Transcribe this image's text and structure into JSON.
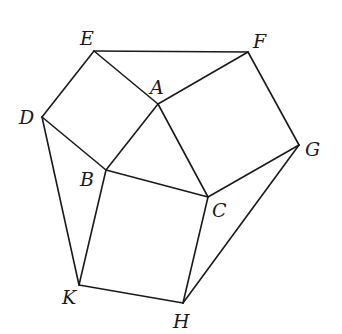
{
  "diagram": {
    "type": "geometry",
    "colors": {
      "stroke": "#1a1a1a",
      "background": "#ffffff"
    },
    "points": {
      "A": {
        "x": 158,
        "y": 104,
        "label": "A",
        "lx": 150,
        "ly": 94
      },
      "B": {
        "x": 106,
        "y": 170,
        "label": "B",
        "lx": 80,
        "ly": 186
      },
      "C": {
        "x": 208,
        "y": 197,
        "label": "C",
        "lx": 212,
        "ly": 217
      },
      "D": {
        "x": 42,
        "y": 117,
        "label": "D",
        "lx": 19,
        "ly": 124
      },
      "E": {
        "x": 94,
        "y": 51,
        "label": "E",
        "lx": 80,
        "ly": 45
      },
      "F": {
        "x": 248,
        "y": 52,
        "label": "F",
        "lx": 253,
        "ly": 48
      },
      "G": {
        "x": 299,
        "y": 145,
        "label": "G",
        "lx": 305,
        "ly": 156
      },
      "H": {
        "x": 183,
        "y": 303,
        "label": "H",
        "lx": 173,
        "ly": 328
      },
      "K": {
        "x": 79,
        "y": 285,
        "label": "K",
        "lx": 62,
        "ly": 304
      }
    },
    "edges": [
      [
        "A",
        "E"
      ],
      [
        "E",
        "D"
      ],
      [
        "D",
        "B"
      ],
      [
        "B",
        "A"
      ],
      [
        "A",
        "F"
      ],
      [
        "F",
        "G"
      ],
      [
        "G",
        "C"
      ],
      [
        "C",
        "A"
      ],
      [
        "B",
        "C"
      ],
      [
        "C",
        "H"
      ],
      [
        "H",
        "K"
      ],
      [
        "K",
        "B"
      ],
      [
        "E",
        "F"
      ],
      [
        "D",
        "K"
      ],
      [
        "G",
        "H"
      ]
    ]
  }
}
